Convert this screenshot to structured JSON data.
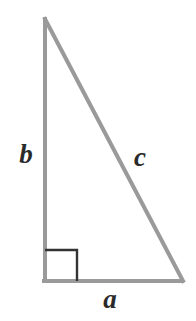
{
  "figure": {
    "type": "geometry-diagram",
    "shape": "right-triangle",
    "background_color": "#ffffff",
    "width": 196,
    "height": 321
  },
  "triangle": {
    "stroke_color": "#9a9a9a",
    "stroke_width": 4,
    "vertices": {
      "apex": {
        "x": 45,
        "y": 19
      },
      "bottom_left": {
        "x": 45,
        "y": 281
      },
      "bottom_right": {
        "x": 182,
        "y": 281
      }
    }
  },
  "right_angle_marker": {
    "stroke_color": "#333333",
    "stroke_width": 2,
    "corner": "bottom-left",
    "size": 32,
    "x": 45,
    "y": 250
  },
  "labels": {
    "leg_vertical": {
      "text": "b",
      "color": "#2a2a2a",
      "x": 26,
      "y": 157
    },
    "hypotenuse": {
      "text": "c",
      "color": "#2a2a2a",
      "x": 140,
      "y": 160
    },
    "leg_horizontal": {
      "text": "a",
      "color": "#2a2a2a",
      "x": 110,
      "y": 301
    }
  }
}
